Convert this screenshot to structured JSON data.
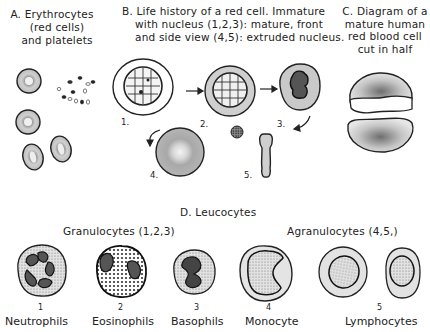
{
  "panels": {
    "A": {
      "title_lines": [
        "A. Erythrocytes",
        "(red cells)",
        "and platelets"
      ]
    },
    "B": {
      "title_lines": [
        "B. Life history of a red cell.  Immature",
        "with nucleus (1,2,3):   mature, front",
        "and side view (4,5):  extruded nucleus."
      ],
      "stage_labels": [
        "1.",
        "2.",
        "3.",
        "4.",
        "5."
      ]
    },
    "C": {
      "title_lines": [
        "C. Diagram of a",
        "mature human",
        "red blood cell",
        "cut in half"
      ]
    },
    "D": {
      "title": "D.  Leucocytes",
      "group_granulocytes": "Granulocytes (1,2,3)",
      "group_agranulocytes": "Agranulocytes (4,5,)",
      "cells": [
        {
          "num": "1",
          "name": "Neutrophils"
        },
        {
          "num": "2",
          "name": "Eosinophils"
        },
        {
          "num": "3",
          "name": "Basophils"
        },
        {
          "num": "4",
          "name": "Monocyte"
        },
        {
          "num": "5",
          "name": "Lymphocytes"
        }
      ]
    }
  },
  "colors": {
    "ink": "#222222",
    "stipple_light": "#c8c8c8",
    "stipple_mid": "#9a9a9a",
    "stipple_dark": "#4a4a4a"
  }
}
